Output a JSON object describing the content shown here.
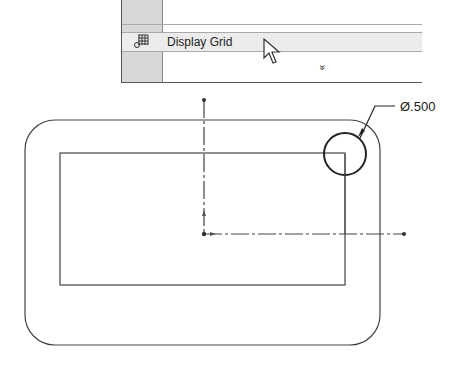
{
  "menu": {
    "items": [
      {
        "label": "",
        "icon": "partial-icon"
      },
      {
        "label": "Display Grid",
        "icon": "grid-icon"
      }
    ],
    "expand_glyph": "»"
  },
  "drawing": {
    "dimension_label": "Ø.500"
  }
}
